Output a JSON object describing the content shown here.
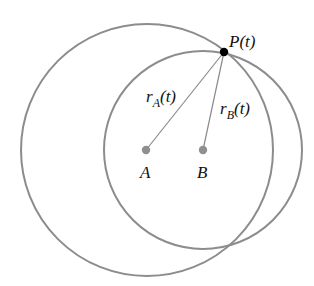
{
  "diagram": {
    "type": "two-circles-distance",
    "colors": {
      "circle_stroke": "#8c8c8c",
      "center_dot": "#8f8f8f",
      "radius_line": "#8a8a8a",
      "point_fill": "#000000",
      "text": "#111111"
    },
    "circles": [
      {
        "name": "circle-A",
        "cx": 147,
        "cy": 150,
        "r": 126
      },
      {
        "name": "circle-B",
        "cx": 203,
        "cy": 150,
        "r": 99
      }
    ],
    "points": {
      "P": {
        "x": 224,
        "y": 52,
        "label": "P(t)"
      },
      "A": {
        "x": 146,
        "y": 150,
        "label": "A"
      },
      "B": {
        "x": 203,
        "y": 150,
        "label": "B"
      }
    },
    "segments": [
      {
        "from": "A",
        "to": "P",
        "label_main": "r",
        "label_sub": "A",
        "label_tail": "(t)"
      },
      {
        "from": "B",
        "to": "P",
        "label_main": "r",
        "label_sub": "B",
        "label_tail": "(t)"
      }
    ]
  }
}
